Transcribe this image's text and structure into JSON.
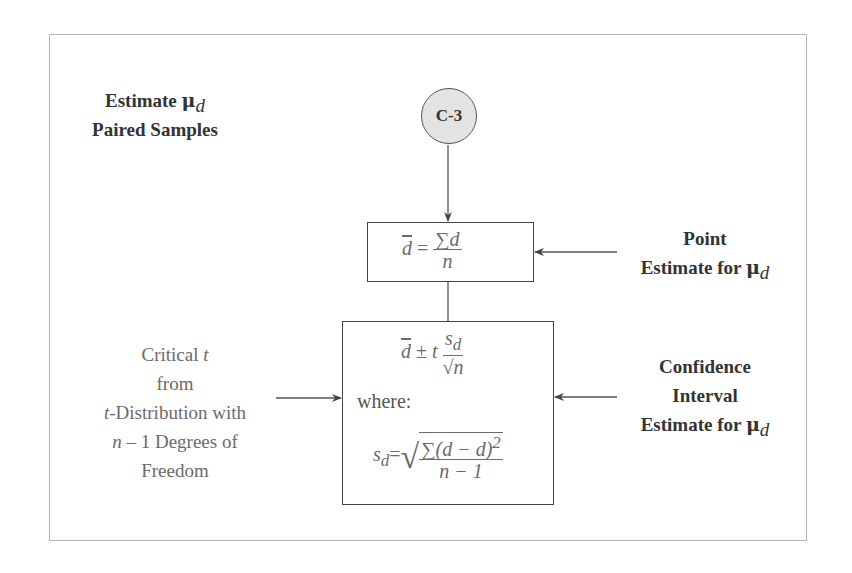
{
  "frame": {
    "border_color": "#b5b5b5"
  },
  "node": {
    "id": "C-3",
    "fill": "#e3e3e3"
  },
  "title": {
    "line1": "Estimate",
    "mu": "μ",
    "mu_sub": "d",
    "line2": "Paired Samples"
  },
  "point_estimate": {
    "formula": {
      "lhs": "d",
      "eq": "=",
      "num": "∑d",
      "den": "n"
    },
    "label_line1": "Point",
    "label_line2": "Estimate for",
    "mu": "μ",
    "mu_sub": "d"
  },
  "interval": {
    "formula": {
      "lhs": "d",
      "pm": "±",
      "t": "t",
      "num_s": "s",
      "num_sub": "d",
      "den": "√n"
    },
    "where": "where:",
    "sd_formula": {
      "lhs": "s",
      "lhs_sub": "d",
      "eq": "=",
      "num": "∑(d − d)",
      "num_exp": "2",
      "den": "n − 1"
    },
    "label_line1": "Confidence",
    "label_line2": "Interval",
    "label_line3": "Estimate for",
    "mu": "μ",
    "mu_sub": "d"
  },
  "critical_t": {
    "line1": "Critical",
    "line1_var": "t",
    "line2": "from",
    "line3_var": "t",
    "line3": "-Distribution with",
    "line4_var": "n",
    "line4": " – 1 Degrees of",
    "line5": "Freedom"
  }
}
